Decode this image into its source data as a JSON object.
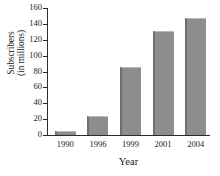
{
  "chart_data": {
    "type": "bar",
    "title": "",
    "xlabel": "Year",
    "ylabel": "Subscribers (in millions)",
    "ylabel_line1": "Subscribers",
    "ylabel_line2": "(in millions)",
    "categories": [
      "1990",
      "1996",
      "1999",
      "2001",
      "2004"
    ],
    "values": [
      5,
      24,
      86,
      131,
      148
    ],
    "ylim": [
      0,
      160
    ],
    "ytick_step": 20,
    "yticks": [
      "0",
      "20",
      "40",
      "60",
      "80",
      "100",
      "120",
      "140",
      "160"
    ],
    "grid": false,
    "legend": "none",
    "series": [
      {
        "name": "Subscribers",
        "values": [
          5,
          24,
          86,
          131,
          148
        ]
      }
    ],
    "colors": {
      "bar_fill": "#8d8d8d",
      "bar_edge_left": "#6e6e6e",
      "bar_edge_top": "#b9b9b9",
      "axis": "#2b2b2b",
      "text": "#1b1b1b",
      "background": "#ffffff"
    }
  }
}
